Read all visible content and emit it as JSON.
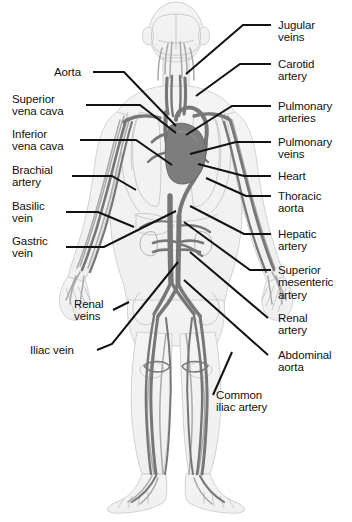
{
  "figure": {
    "background_color": "#ffffff",
    "text_color": "#111111",
    "leader_line_color": "#111111",
    "vessel_dark_color": "#6f6f6f",
    "vessel_mid_color": "#8c8c8c",
    "vessel_light_color": "#b5b5b5",
    "body_outline_color": "#c9c9c9",
    "body_fill_color": "#f2f2f2",
    "heart_color": "#7a7a7a",
    "width": 352,
    "height": 522
  },
  "labels": {
    "left": [
      {
        "id": "aorta",
        "text": "Aorta"
      },
      {
        "id": "superior-vena-cava",
        "text": "Superior\nvena cava"
      },
      {
        "id": "inferior-vena-cava",
        "text": "Inferior\nvena cava"
      },
      {
        "id": "brachial-artery",
        "text": "Brachial\nartery"
      },
      {
        "id": "basilic-vein",
        "text": "Basilic\nvein"
      },
      {
        "id": "gastric-vein",
        "text": "Gastric\nvein"
      },
      {
        "id": "renal-veins",
        "text": "Renal\nveins"
      },
      {
        "id": "iliac-vein",
        "text": "Iliac vein"
      }
    ],
    "right": [
      {
        "id": "jugular-veins",
        "text": "Jugular\nveins"
      },
      {
        "id": "carotid-artery",
        "text": "Carotid\nartery"
      },
      {
        "id": "pulmonary-arteries",
        "text": "Pulmonary\narteries"
      },
      {
        "id": "pulmonary-veins",
        "text": "Pulmonary\nveins"
      },
      {
        "id": "heart",
        "text": "Heart"
      },
      {
        "id": "thoracic-aorta",
        "text": "Thoracic\naorta"
      },
      {
        "id": "hepatic-artery",
        "text": "Hepatic\nartery"
      },
      {
        "id": "superior-mesenteric-artery",
        "text": "Superior\nmesenteric\nartery"
      },
      {
        "id": "renal-artery",
        "text": "Renal\nartery"
      },
      {
        "id": "abdominal-aorta",
        "text": "Abdominal\naorta"
      }
    ],
    "bottom": [
      {
        "id": "common-iliac-artery",
        "text": "Common\niliac artery"
      }
    ]
  },
  "anatomy_parts": [
    "head",
    "brain",
    "neck",
    "torso",
    "ribcage",
    "lungs",
    "heart",
    "left-arm",
    "right-arm",
    "hands",
    "kidneys",
    "pelvis",
    "left-leg",
    "right-leg",
    "feet"
  ]
}
